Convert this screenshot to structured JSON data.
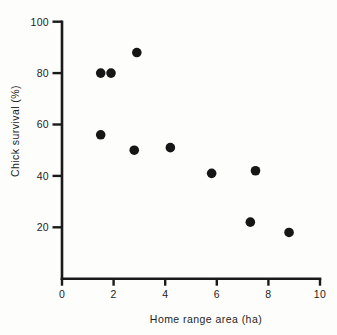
{
  "figure": {
    "background_color": "#fdfdfb",
    "ink_color": "#1a1a1a"
  },
  "chart_data": {
    "type": "scatter",
    "title": "",
    "xlabel": "Home range area (ha)",
    "ylabel": "Chick survival (%)",
    "xlim": [
      0,
      10
    ],
    "ylim": [
      0,
      100
    ],
    "x_ticks": [
      0,
      2,
      4,
      6,
      8,
      10
    ],
    "y_ticks": [
      20,
      40,
      60,
      80,
      100
    ],
    "grid": false,
    "legend": "none",
    "marker": {
      "shape": "filled-circle",
      "color": "#161616",
      "radius_px": 4.8
    },
    "points": [
      {
        "x": 1.5,
        "y": 56
      },
      {
        "x": 1.5,
        "y": 80
      },
      {
        "x": 1.9,
        "y": 80
      },
      {
        "x": 2.8,
        "y": 50
      },
      {
        "x": 2.9,
        "y": 88
      },
      {
        "x": 4.2,
        "y": 51
      },
      {
        "x": 5.8,
        "y": 41
      },
      {
        "x": 7.3,
        "y": 22
      },
      {
        "x": 7.5,
        "y": 42
      },
      {
        "x": 8.8,
        "y": 18
      }
    ]
  }
}
